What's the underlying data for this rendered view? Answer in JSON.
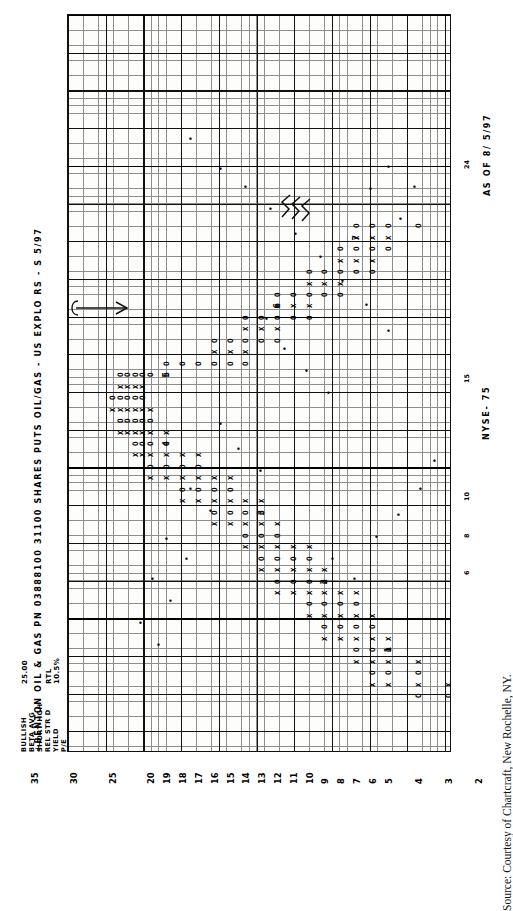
{
  "figure": {
    "title": "+BENTON OIL & GAS PN 03888100  31100 SHARES PUTS  OIL/GAS - US EXPLO   RS - S  5/97",
    "as_of": "AS OF  8/ 5/97",
    "exchange": "NYSE- 75",
    "source_caption": "Source: Courtesy of Chartcraft, New Rochelle, NY."
  },
  "stats": {
    "rows": [
      {
        "label": "BULLISH",
        "value": "25.00"
      },
      {
        "label": "BETA  AVG",
        "value": ""
      },
      {
        "label": "SHORT HGH",
        "value": ""
      },
      {
        "label": "REL STR D",
        "value": "RTL"
      },
      {
        "label": "YIELD",
        "value": "10.5%"
      },
      {
        "label": "P/E",
        "value": ""
      }
    ]
  },
  "chart_data": {
    "type": "line",
    "subtype": "point-and-figure",
    "title": "+BENTON OIL & GAS PN 03888100  31100 SHARES PUTS  OIL/GAS - US EXPLO   RS - S  5/97",
    "xlabel": "",
    "ylabel": "Price",
    "orientation": "rotated-90",
    "grid": true,
    "legend": "none",
    "price_axis_labels": [
      "35",
      "30",
      "25",
      "20",
      "19",
      "18",
      "17",
      "16",
      "15",
      "14",
      "13",
      "12",
      "11",
      "10",
      "9",
      "8",
      "7",
      "6",
      "5",
      "4",
      "3",
      "2"
    ],
    "price_axis_values": [
      35,
      30,
      25,
      20,
      19,
      18,
      17,
      16,
      15,
      14,
      13,
      12,
      11,
      10,
      9,
      8,
      7,
      6,
      5,
      4,
      3,
      2
    ],
    "annotations": [
      {
        "text": "arrow",
        "note": "hand-drawn arrow pointing right at the 23-24 level"
      },
      {
        "text": "scribble",
        "note": "hand-drawn squiggle near top right of pattern"
      }
    ],
    "marks_legend": {
      "X": "rising column (demand)",
      "O": "falling column (supply)",
      "+": "breakout / half-box mark",
      "digit": "month marker (1-9)",
      "N": "November",
      "D": "December"
    },
    "columns": [
      {
        "x": 2,
        "mark": "O",
        "from": 4,
        "to": 3
      },
      {
        "x": 3,
        "mark": "X",
        "from": 3,
        "to": 6
      },
      {
        "x": 4,
        "mark": "O",
        "from": 6,
        "to": 4
      },
      {
        "x": 5,
        "mark": "X",
        "from": 4,
        "to": 7
      },
      {
        "x": 6,
        "mark": "O",
        "from": 7,
        "to": 5
      },
      {
        "x": 7,
        "mark": "X",
        "from": 5,
        "to": 9
      },
      {
        "x": 8,
        "mark": "O",
        "from": 9,
        "to": 6
      },
      {
        "x": 9,
        "mark": "X",
        "from": 6,
        "to": 10
      },
      {
        "x": 10,
        "mark": "O",
        "from": 10,
        "to": 7
      },
      {
        "x": 11,
        "mark": "X",
        "from": 7,
        "to": 12
      },
      {
        "x": 12,
        "mark": "O",
        "from": 12,
        "to": 9
      },
      {
        "x": 13,
        "mark": "X",
        "from": 9,
        "to": 13
      },
      {
        "x": 14,
        "mark": "O",
        "from": 13,
        "to": 10
      },
      {
        "x": 15,
        "mark": "X",
        "from": 10,
        "to": 14
      },
      {
        "x": 16,
        "mark": "O",
        "from": 14,
        "to": 12
      },
      {
        "x": 17,
        "mark": "X",
        "from": 12,
        "to": 16
      },
      {
        "x": 18,
        "mark": "O",
        "from": 16,
        "to": 13
      },
      {
        "x": 19,
        "mark": "X",
        "from": 13,
        "to": 18
      },
      {
        "x": 20,
        "mark": "O",
        "from": 18,
        "to": 15
      },
      {
        "x": 21,
        "mark": "X",
        "from": 15,
        "to": 20
      },
      {
        "x": 22,
        "mark": "O",
        "from": 20,
        "to": 17
      },
      {
        "x": 23,
        "mark": "X",
        "from": 17,
        "to": 22
      },
      {
        "x": 24,
        "mark": "O",
        "from": 22,
        "to": 19
      },
      {
        "x": 25,
        "mark": "X",
        "from": 19,
        "to": 24
      },
      {
        "x": 26,
        "mark": "O",
        "from": 24,
        "to": 20
      },
      {
        "x": 27,
        "mark": "X",
        "from": 20,
        "to": 25
      },
      {
        "x": 28,
        "mark": "O",
        "from": 25,
        "to": 21
      },
      {
        "x": 29,
        "mark": "X",
        "from": 21,
        "to": 24
      },
      {
        "x": 30,
        "mark": "O",
        "from": 24,
        "to": 19
      },
      {
        "x": 31,
        "mark": "O",
        "from": 19,
        "to": 14
      },
      {
        "x": 32,
        "mark": "X",
        "from": 14,
        "to": 16
      },
      {
        "x": 33,
        "mark": "O",
        "from": 16,
        "to": 12
      },
      {
        "x": 34,
        "mark": "X",
        "from": 12,
        "to": 14
      },
      {
        "x": 35,
        "mark": "O",
        "from": 14,
        "to": 10
      },
      {
        "x": 36,
        "mark": "X",
        "from": 10,
        "to": 12
      },
      {
        "x": 37,
        "mark": "O",
        "from": 12,
        "to": 8
      },
      {
        "x": 38,
        "mark": "X",
        "from": 8,
        "to": 10
      },
      {
        "x": 39,
        "mark": "O",
        "from": 10,
        "to": 6
      },
      {
        "x": 40,
        "mark": "X",
        "from": 6,
        "to": 8
      },
      {
        "x": 41,
        "mark": "O",
        "from": 8,
        "to": 5
      },
      {
        "x": 42,
        "mark": "X",
        "from": 5,
        "to": 7
      },
      {
        "x": 43,
        "mark": "O",
        "from": 7,
        "to": 4
      }
    ]
  },
  "price_ticks_right": [
    {
      "label": "24",
      "pos": 0.21
    },
    {
      "label": "15",
      "pos": 0.5
    },
    {
      "label": "10",
      "pos": 0.66
    },
    {
      "label": "8",
      "pos": 0.71
    },
    {
      "label": "6",
      "pos": 0.76
    }
  ]
}
